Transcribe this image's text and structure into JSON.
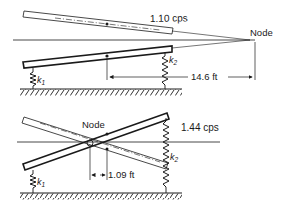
{
  "figure": {
    "top": {
      "mode_label": "1.10 cps",
      "node_label": "Node",
      "distance_label": "14.6 ft",
      "spring_left_label": "k",
      "spring_left_sub": "1",
      "spring_right_label": "k",
      "spring_right_sub": "2"
    },
    "bottom": {
      "mode_label": "1.44 cps",
      "node_label": "Node",
      "distance_label": "1.09 ft",
      "spring_left_label": "k",
      "spring_left_sub": "1",
      "spring_right_label": "k",
      "spring_right_sub": "2"
    }
  },
  "colors": {
    "ink": "#1a1a1a",
    "background": "#ffffff"
  }
}
